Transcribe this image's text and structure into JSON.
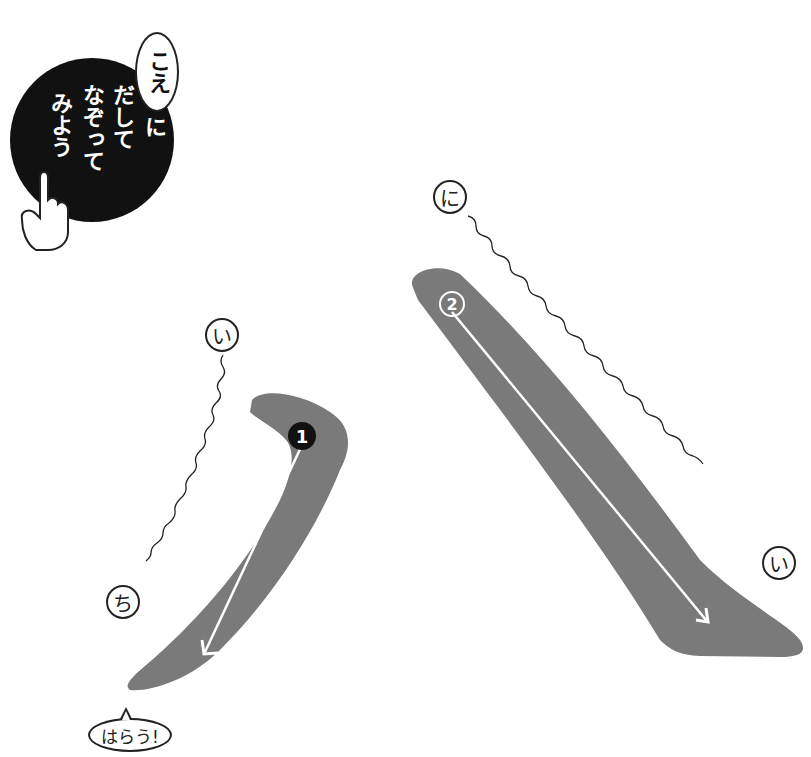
{
  "instruction_badge": {
    "bubble_text": "こえ",
    "lines": [
      "に",
      "だして",
      "なぞって",
      "みよう"
    ],
    "icon": "pointing-hand-icon"
  },
  "strokes": [
    {
      "number": "1",
      "badge_style": "filled-black",
      "start_label": "い",
      "end_label": "ち",
      "direction": "down-left",
      "note_label": "はらう!"
    },
    {
      "number": "2",
      "badge_style": "outlined-white",
      "start_label": "に",
      "end_label": "い",
      "direction": "down-right"
    }
  ],
  "colors": {
    "stroke_fill": "#7a7a7a",
    "badge_bg": "#111111",
    "line": "#222222"
  }
}
